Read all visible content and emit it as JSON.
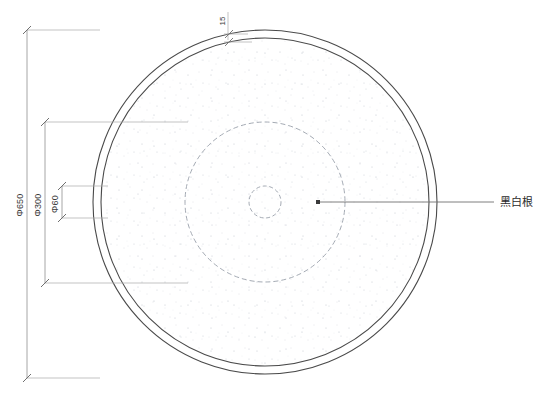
{
  "drawing": {
    "type": "cad-plan-view",
    "title": "Circular stone tabletop plan",
    "background_color": "#ffffff",
    "line_color": "#555555",
    "dim_line_color": "#8a8a8a",
    "text_color": "#3a3a3a",
    "stipple_color": "#c9ccd4"
  },
  "geometry": {
    "center": {
      "cx": 265,
      "cy": 202
    },
    "circles": [
      {
        "name": "outer-rim-circle",
        "radius": 172,
        "style": "solid",
        "label": "Φ650 outer edge"
      },
      {
        "name": "inner-rim-circle",
        "radius": 164,
        "style": "solid",
        "label": "inner edge of 15mm band"
      },
      {
        "name": "mid-dashed-circle",
        "radius": 80,
        "style": "dashed",
        "label": "Φ300 hidden circle"
      },
      {
        "name": "center-dashed-circle",
        "radius": 16,
        "style": "dashed",
        "label": "Φ60 hidden circle"
      }
    ]
  },
  "dimensions": {
    "overall": {
      "name": "phi-650",
      "value": "Φ650",
      "orientation": "vertical",
      "x": 27,
      "y_top": 30,
      "y_bottom": 378
    },
    "middle": {
      "name": "phi-300",
      "value": "Φ300",
      "orientation": "vertical",
      "x": 45,
      "y_top": 122,
      "y_bottom": 283
    },
    "center": {
      "name": "phi-60",
      "value": "Φ60",
      "orientation": "vertical",
      "x": 62,
      "y_top": 186,
      "y_bottom": 218
    },
    "edge_band": {
      "name": "band-15",
      "value": "15",
      "orientation": "vertical",
      "x": 228,
      "y_top": 10,
      "y_bottom": 34
    }
  },
  "annotations": [
    {
      "name": "material-callout",
      "text": "黑白根",
      "leader_start_x": 318,
      "leader_start_y": 202,
      "leader_end_x": 494,
      "leader_end_y": 202,
      "text_x": 500,
      "text_y": 206
    }
  ]
}
